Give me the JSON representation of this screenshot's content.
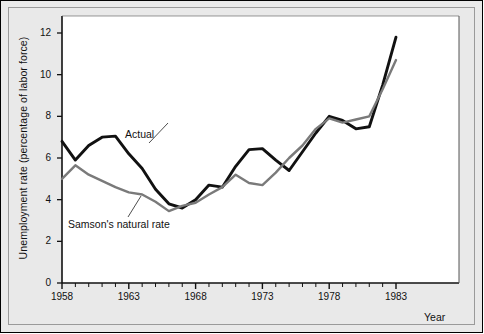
{
  "chart_data": {
    "type": "line",
    "title": "",
    "xlabel": "Year",
    "ylabel": "Unemployment rate (percentage of labor force)",
    "xlim": [
      1958,
      1983
    ],
    "ylim": [
      0,
      12
    ],
    "grid": false,
    "legend_position": "inline-annotations",
    "x": [
      1958,
      1959,
      1960,
      1961,
      1962,
      1963,
      1964,
      1965,
      1966,
      1967,
      1968,
      1969,
      1970,
      1971,
      1972,
      1973,
      1974,
      1975,
      1976,
      1977,
      1978,
      1979,
      1980,
      1981,
      1982,
      1983
    ],
    "xtick_labels": [
      "1958",
      "1963",
      "1968",
      "1973",
      "1978",
      "1983"
    ],
    "xtick_values": [
      1958,
      1963,
      1968,
      1973,
      1978,
      1983
    ],
    "ytick_labels": [
      "0",
      "2",
      "4",
      "6",
      "8",
      "10",
      "12"
    ],
    "ytick_values": [
      0,
      2,
      4,
      6,
      8,
      10,
      12
    ],
    "series": [
      {
        "name": "Actual",
        "color": "#111111",
        "values": [
          6.8,
          5.9,
          6.6,
          7.0,
          7.05,
          6.2,
          5.5,
          4.5,
          3.8,
          3.6,
          4.0,
          4.7,
          4.6,
          5.6,
          6.4,
          6.45,
          5.9,
          5.4,
          6.3,
          7.2,
          8.0,
          7.8,
          7.4,
          7.5,
          9.5,
          11.8
        ]
      },
      {
        "name": "Samson's natural rate",
        "color": "#7a7a7a",
        "values": [
          5.0,
          5.65,
          5.2,
          4.9,
          4.6,
          4.35,
          4.25,
          3.9,
          3.45,
          3.7,
          3.85,
          4.25,
          4.6,
          5.2,
          4.8,
          4.7,
          5.3,
          6.0,
          6.6,
          7.4,
          7.9,
          7.7,
          7.85,
          8.0,
          9.3,
          10.7
        ]
      }
    ],
    "annotations": [
      {
        "text": "Actual",
        "x_px": 125,
        "y_px": 128,
        "leader_from_px": [
          149,
          143
        ],
        "leader_to_px": [
          168,
          123
        ]
      },
      {
        "text": "Samson's natural rate",
        "x_px": 68,
        "y_px": 218,
        "leader_from_px": [
          128,
          217
        ],
        "leader_to_px": [
          141,
          196
        ]
      }
    ]
  }
}
